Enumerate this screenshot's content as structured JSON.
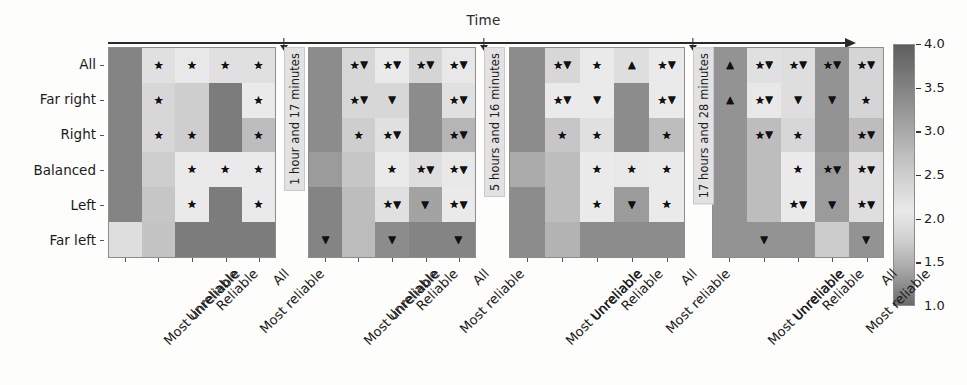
{
  "figure": {
    "time_axis_title": "Time",
    "y_axis_categories": [
      "All",
      "Far right",
      "Right",
      "Balanced",
      "Left",
      "Far left"
    ],
    "x_axis_categories": [
      "Most unreliable",
      "Unreliable",
      "Reliable",
      "Most reliable",
      "All"
    ],
    "time_gap_labels": [
      "1 hour and 17 minutes",
      "5 hours and 16 minutes",
      "17 hours and 28 minutes"
    ],
    "colorbar": {
      "tick_labels": [
        "4.0",
        "3.5",
        "3.0",
        "2.5",
        "2.0",
        "1.5",
        "1.0"
      ],
      "min": 1.0,
      "max": 4.0
    },
    "marker_legend": {
      "star": "★",
      "triangle_down": "▼",
      "triangle_up": "▲"
    }
  },
  "chart_data": {
    "type": "heatmap",
    "title": "Time",
    "xlabel": "",
    "ylabel": "",
    "grid": false,
    "legend_position": "right",
    "colorbar_label": "",
    "zlim": [
      1.0,
      4.0
    ],
    "colormap": "gray-diverging (dark-light-dark)",
    "x": [
      "Most unreliable",
      "Unreliable",
      "Reliable",
      "Most reliable",
      "All"
    ],
    "y": [
      "All",
      "Far right",
      "Right",
      "Balanced",
      "Left",
      "Far left"
    ],
    "panels": [
      {
        "name": "panel-1",
        "time_gap_after": "1 hour and 17 minutes",
        "values": [
          [
            1.6,
            3.0,
            2.8,
            3.0,
            3.0
          ],
          [
            1.6,
            3.1,
            3.2,
            1.5,
            2.9
          ],
          [
            1.6,
            3.1,
            3.2,
            1.5,
            3.4
          ],
          [
            1.6,
            3.2,
            2.9,
            2.9,
            2.9
          ],
          [
            1.6,
            3.3,
            2.9,
            1.5,
            2.9
          ],
          [
            2.7,
            2.4,
            1.5,
            1.5,
            1.5
          ]
        ],
        "markers": [
          [
            "",
            "star",
            "star",
            "star",
            "star"
          ],
          [
            "",
            "star",
            "",
            "",
            "star"
          ],
          [
            "",
            "star",
            "star",
            "",
            "star"
          ],
          [
            "",
            "",
            "star",
            "star",
            "star"
          ],
          [
            "",
            "",
            "star",
            "",
            "star"
          ],
          [
            "",
            "",
            "",
            "",
            ""
          ]
        ]
      },
      {
        "name": "panel-2",
        "time_gap_after": "5 hours and 16 minutes",
        "values": [
          [
            1.7,
            3.1,
            2.9,
            2.6,
            2.8
          ],
          [
            1.7,
            3.1,
            3.1,
            1.7,
            3.0
          ],
          [
            1.7,
            3.2,
            3.0,
            1.7,
            3.5
          ],
          [
            1.9,
            3.3,
            2.9,
            2.7,
            2.8
          ],
          [
            1.6,
            3.4,
            3.0,
            2.0,
            2.9
          ],
          [
            1.6,
            2.3,
            1.7,
            1.6,
            1.6
          ]
        ],
        "markers": [
          [
            "",
            "star+down",
            "star+down",
            "star+down",
            "star+down"
          ],
          [
            "",
            "star+down",
            "down",
            "",
            "star+down"
          ],
          [
            "",
            "star",
            "star+down",
            "",
            "star+down"
          ],
          [
            "",
            "",
            "star",
            "star+down",
            "star+down"
          ],
          [
            "",
            "",
            "star+down",
            "down",
            "star+down"
          ],
          [
            "down",
            "",
            "down",
            "",
            "down"
          ]
        ]
      },
      {
        "name": "panel-3",
        "time_gap_after": "17 hours and 28 minutes",
        "values": [
          [
            1.7,
            3.1,
            2.9,
            2.7,
            2.9
          ],
          [
            1.7,
            2.9,
            2.9,
            1.7,
            2.9
          ],
          [
            1.7,
            3.3,
            3.0,
            1.7,
            3.4
          ],
          [
            2.1,
            3.4,
            2.9,
            2.8,
            2.9
          ],
          [
            1.7,
            3.4,
            2.9,
            1.9,
            2.9
          ],
          [
            1.7,
            2.2,
            1.7,
            1.7,
            1.7
          ]
        ],
        "markers": [
          [
            "",
            "star+down",
            "star",
            "up",
            "star+down"
          ],
          [
            "",
            "star+down",
            "down",
            "",
            "star+down"
          ],
          [
            "",
            "star",
            "star",
            "",
            "star"
          ],
          [
            "",
            "",
            "star",
            "star",
            "star"
          ],
          [
            "",
            "",
            "star",
            "down",
            "star"
          ],
          [
            "",
            "",
            "",
            "",
            ""
          ]
        ]
      },
      {
        "name": "panel-4",
        "time_gap_after": "",
        "values": [
          [
            1.8,
            3.0,
            2.7,
            1.8,
            2.6
          ],
          [
            1.8,
            2.8,
            2.7,
            1.8,
            2.6
          ],
          [
            1.8,
            3.4,
            3.1,
            1.8,
            3.4
          ],
          [
            1.8,
            3.4,
            2.9,
            1.9,
            2.7
          ],
          [
            1.8,
            3.4,
            2.9,
            1.9,
            2.7
          ],
          [
            1.8,
            1.8,
            1.8,
            2.5,
            1.8
          ]
        ],
        "markers": [
          [
            "up",
            "star+down",
            "star+down",
            "star+down",
            "star+down"
          ],
          [
            "up",
            "star+down",
            "down",
            "down",
            "star"
          ],
          [
            "",
            "star+down",
            "star",
            "",
            "star+down"
          ],
          [
            "",
            "",
            "star",
            "star+down",
            "star+down"
          ],
          [
            "",
            "",
            "star+down",
            "down",
            "star+down"
          ],
          [
            "",
            "down",
            "",
            "",
            "down"
          ]
        ]
      }
    ]
  }
}
